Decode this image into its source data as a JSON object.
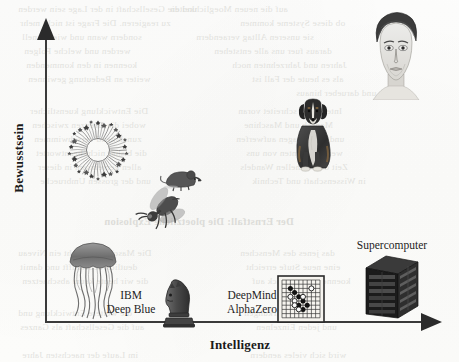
{
  "figure": {
    "kind": "conceptual-scatter-plot",
    "language": "de",
    "page_background": "#fdfdfc",
    "ink_color": "#2b2b2b"
  },
  "axes": {
    "y": {
      "title": "Bewusstsein",
      "orientation": "vertical",
      "arrow": "up",
      "has_ticks": false,
      "has_scale_numbers": false
    },
    "x": {
      "title": "Intelligenz",
      "orientation": "horizontal",
      "arrow": "right",
      "has_ticks": false,
      "has_scale_numbers": false
    }
  },
  "labels": {
    "deep_blue": "IBM\nDeep Blue",
    "alphazero": "DeepMind\nAlphaZero",
    "supercomputer": "Supercomputer"
  },
  "chart_data": {
    "type": "scatter",
    "title": "",
    "subtitle": "",
    "xlabel": "Intelligenz",
    "ylabel": "Bewusstsein",
    "xlim": [
      0,
      100
    ],
    "ylim": [
      0,
      100
    ],
    "grid": false,
    "legend": "none",
    "axis_ticks": false,
    "point_marker": "illustration",
    "points": [
      {
        "name": "neural-ring",
        "icon": "neural-ring-icon",
        "label": "",
        "x": 6,
        "y": 72,
        "group": "organism"
      },
      {
        "name": "jellyfish",
        "icon": "jellyfish-icon",
        "label": "",
        "x": 6,
        "y": 24,
        "group": "organism"
      },
      {
        "name": "insect",
        "icon": "insect-icon",
        "label": "",
        "x": 25,
        "y": 45,
        "group": "organism"
      },
      {
        "name": "mouse",
        "icon": "mouse-icon",
        "label": "",
        "x": 35,
        "y": 54,
        "group": "organism"
      },
      {
        "name": "dog",
        "icon": "dog-icon",
        "label": "",
        "x": 69,
        "y": 80,
        "group": "organism"
      },
      {
        "name": "human",
        "icon": "human-portrait-icon",
        "label": "",
        "x": 90,
        "y": 96,
        "group": "organism"
      },
      {
        "name": "deep-blue",
        "icon": "chess-knight-icon",
        "label": "IBM\nDeep Blue",
        "x": 32,
        "y": 5,
        "group": "machine"
      },
      {
        "name": "alphazero",
        "icon": "go-board-icon",
        "label": "DeepMind\nAlphaZero",
        "x": 64,
        "y": 5,
        "group": "machine"
      },
      {
        "name": "supercomputer",
        "icon": "server-rack-icon",
        "label": "Supercomputer",
        "x": 87,
        "y": 12,
        "group": "machine"
      }
    ]
  },
  "background_bleed": {
    "note": "faint mirrored show-through text from the reverse of the scanned book page; not legible content",
    "lines": [
      {
        "x": 18,
        "y": 4,
        "text": "und die Gesellschaft in der Lage sein werden",
        "bold": false
      },
      {
        "x": 170,
        "y": 4,
        "text": "auf die neuen Moeglichkeiten",
        "bold": false
      },
      {
        "x": 20,
        "y": 18,
        "text": "zu reagieren. Die Frage ist nicht mehr",
        "bold": false
      },
      {
        "x": 240,
        "y": 18,
        "text": "ob diese Systeme kommen",
        "bold": false
      },
      {
        "x": 22,
        "y": 32,
        "text": "sondern wann und wie schnell",
        "bold": false
      },
      {
        "x": 196,
        "y": 32,
        "text": "sie unseren Alltag veraendern",
        "bold": false
      },
      {
        "x": 24,
        "y": 46,
        "text": "werden und welche Folgen",
        "bold": false
      },
      {
        "x": 214,
        "y": 46,
        "text": "daraus fuer uns alle entstehen",
        "bold": false
      },
      {
        "x": 26,
        "y": 60,
        "text": "koennen in den kommenden",
        "bold": false
      },
      {
        "x": 232,
        "y": 60,
        "text": "Jahren und Jahrzehnten noch",
        "bold": false
      },
      {
        "x": 28,
        "y": 74,
        "text": "weiter an Bedeutung gewinnen",
        "bold": false
      },
      {
        "x": 252,
        "y": 74,
        "text": "als es heute der Fall ist",
        "bold": false
      },
      {
        "x": 296,
        "y": 88,
        "text": "und darueber hinaus",
        "bold": false
      },
      {
        "x": 30,
        "y": 106,
        "text": "Die Entwicklung kuenstlicher",
        "bold": false
      },
      {
        "x": 238,
        "y": 106,
        "text": "Intelligenz schreitet voran",
        "bold": false
      },
      {
        "x": 32,
        "y": 120,
        "text": "wobei die Grenzen zwischen",
        "bold": false
      },
      {
        "x": 244,
        "y": 120,
        "text": "Mensch und Maschine",
        "bold": false
      },
      {
        "x": 34,
        "y": 134,
        "text": "zunehmend verschwimmen",
        "bold": false
      },
      {
        "x": 236,
        "y": 134,
        "text": "und neue Fragen aufwerfen",
        "bold": false
      },
      {
        "x": 36,
        "y": 148,
        "text": "die bisher nicht beantwortet",
        "bold": false
      },
      {
        "x": 246,
        "y": 148,
        "text": "werden konnten von uns",
        "bold": false
      },
      {
        "x": 38,
        "y": 162,
        "text": "allen gemeinsam in dieser",
        "bold": false
      },
      {
        "x": 240,
        "y": 162,
        "text": "Zeit des schnellen Wandels",
        "bold": false
      },
      {
        "x": 40,
        "y": 176,
        "text": "und der grossen Umbrueche",
        "bold": false
      },
      {
        "x": 252,
        "y": 176,
        "text": "in Wissenschaft und Technik",
        "bold": false
      },
      {
        "x": 104,
        "y": 216,
        "text": "Der Ernstfall: Die ploetzliche Explosion",
        "bold": true
      },
      {
        "x": 18,
        "y": 248,
        "text": "Die Maschine erreicht ein Niveau",
        "bold": false
      },
      {
        "x": 240,
        "y": 248,
        "text": "das jenes des Menschen",
        "bold": false
      },
      {
        "x": 20,
        "y": 262,
        "text": "deutlich uebertrifft und damit",
        "bold": false
      },
      {
        "x": 246,
        "y": 262,
        "text": "eine neue Stufe erreicht",
        "bold": false
      },
      {
        "x": 22,
        "y": 276,
        "text": "die wir heute kaum abschaetzen",
        "bold": false
      },
      {
        "x": 252,
        "y": 276,
        "text": "koennen im Hinblick auf",
        "bold": false
      },
      {
        "x": 18,
        "y": 308,
        "text": "die weitere Entwicklung und",
        "bold": false
      },
      {
        "x": 244,
        "y": 308,
        "text": "ihre Auswirkungen",
        "bold": false
      },
      {
        "x": 20,
        "y": 322,
        "text": "auf die Gesellschaft als Ganzes",
        "bold": false
      },
      {
        "x": 256,
        "y": 322,
        "text": "und jeden Einzelnen",
        "bold": false
      },
      {
        "x": 22,
        "y": 350,
        "text": "im Laufe der naechsten Jahre",
        "bold": false
      },
      {
        "x": 250,
        "y": 350,
        "text": "wird sich vieles aendern",
        "bold": false
      }
    ]
  }
}
